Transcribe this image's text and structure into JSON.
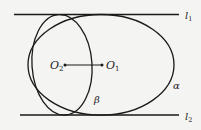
{
  "diagram": {
    "lines": [
      {
        "name": "l1",
        "label": "l",
        "sub": "1"
      },
      {
        "name": "l2",
        "label": "l",
        "sub": "2"
      }
    ],
    "ellipses": [
      {
        "name": "alpha",
        "label": "α"
      },
      {
        "name": "beta",
        "label": "β"
      }
    ],
    "points": [
      {
        "name": "O1",
        "label": "O",
        "sub": "1"
      },
      {
        "name": "O2",
        "label": "O",
        "sub": "2"
      }
    ],
    "colors": {
      "stroke": "#1a1a1a",
      "background": "#f4f4f2"
    }
  }
}
